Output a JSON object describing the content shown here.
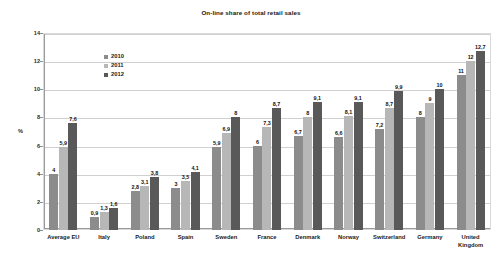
{
  "chart_data": {
    "type": "bar",
    "title": "On-line share of total retail sales",
    "xlabel": "",
    "ylabel": "%",
    "ylim": [
      0,
      14
    ],
    "yticks": [
      0,
      2,
      4,
      6,
      8,
      10,
      12,
      14
    ],
    "grid": true,
    "legend_position": "upper-left-inside",
    "decimal_separator": ",",
    "categories": [
      "Average EU",
      "Italy",
      "Poland",
      "Spain",
      "Sweden",
      "France",
      "Denmark",
      "Norway",
      "Switzerland",
      "Germany",
      "United Kingdom"
    ],
    "series": [
      {
        "name": "2010",
        "color": "#8c8c8c",
        "values": [
          4,
          0.9,
          2.8,
          3,
          5.9,
          6,
          6.7,
          6.6,
          7.2,
          8,
          11
        ],
        "labels": [
          "4",
          "0,9",
          "2,8",
          "3",
          "5,9",
          "6",
          "6,7",
          "6,6",
          "7,2",
          "8",
          "11"
        ]
      },
      {
        "name": "2011",
        "color": "#b7b7b7",
        "values": [
          5.9,
          1.3,
          3.1,
          3.5,
          6.9,
          7.3,
          8,
          8.1,
          8.7,
          9,
          12
        ],
        "labels": [
          "5,9",
          "1,3",
          "3,1",
          "3,5",
          "6,9",
          "7,3",
          "8",
          "8,1",
          "8,7",
          "9",
          "12"
        ]
      },
      {
        "name": "2012",
        "color": "#595959",
        "values": [
          7.6,
          1.6,
          3.8,
          4.1,
          8,
          8.7,
          9.1,
          9.1,
          9.9,
          10,
          12.7
        ],
        "labels": [
          "7,6",
          "1,6",
          "3,8",
          "4,1",
          "8",
          "8,7",
          "9,1",
          "9,1",
          "9,9",
          "10",
          "12,7"
        ]
      }
    ]
  }
}
